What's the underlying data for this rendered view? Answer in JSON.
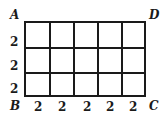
{
  "diagram": {
    "rows": 3,
    "cols": 5,
    "corners": {
      "top_left": "A",
      "top_right": "D",
      "bottom_left": "B",
      "bottom_right": "C"
    },
    "row_labels": [
      "2",
      "2",
      "2"
    ],
    "col_labels": [
      "2",
      "2",
      "2",
      "2",
      "2"
    ],
    "line_color": "#1a1a1a"
  }
}
